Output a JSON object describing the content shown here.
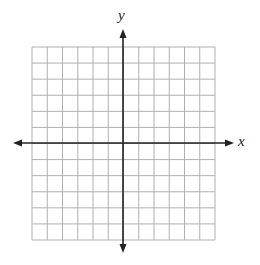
{
  "diagram": {
    "type": "coordinate-grid",
    "x_axis_label": "x",
    "y_axis_label": "y",
    "grid_columns": 12,
    "grid_rows": 12,
    "origin_column_index": 6,
    "origin_row_index": 6,
    "colors": {
      "grid_line": "#b0b0b0",
      "axis": "#222222",
      "background": "#ffffff"
    }
  }
}
